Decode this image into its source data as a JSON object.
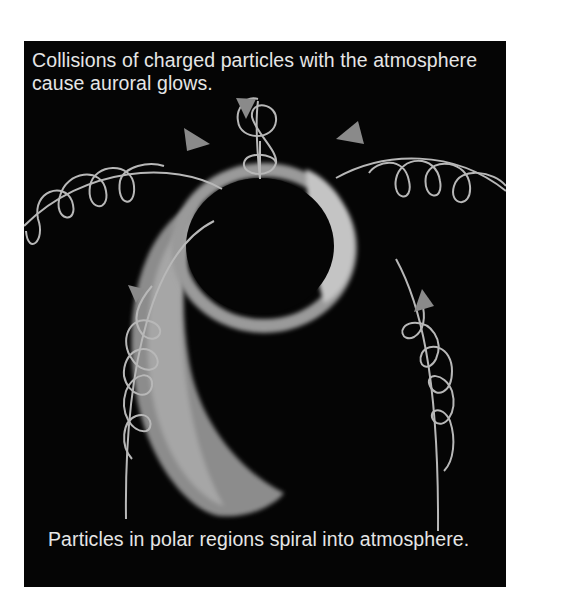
{
  "figure": {
    "top_caption_line1": "Collisions of charged particles with the atmosphere",
    "top_caption_line2": "cause auroral glows.",
    "bottom_caption": "Particles in polar regions spiral into atmosphere.",
    "colors": {
      "background": "#050505",
      "field_line": "#b8b8b8",
      "arrow": "#8a8a8a",
      "aurora_glow": "#c9c9c9",
      "text": "#e6e6e6"
    }
  }
}
